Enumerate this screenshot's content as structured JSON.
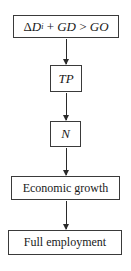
{
  "diagram": {
    "type": "flowchart",
    "direction": "top-to-bottom",
    "nodes": [
      {
        "id": "condition",
        "label": "ΔDi + GD > GO",
        "parts": {
          "delta": "Δ",
          "d": "D",
          "sub_i": "i",
          "plus": " + ",
          "gd": "GD",
          "gt": " > ",
          "go": "GO"
        }
      },
      {
        "id": "tp",
        "label": "TP"
      },
      {
        "id": "n",
        "label": "N"
      },
      {
        "id": "growth",
        "label": "Economic growth"
      },
      {
        "id": "employment",
        "label": "Full employment"
      }
    ],
    "edges": [
      {
        "from": "condition",
        "to": "tp"
      },
      {
        "from": "tp",
        "to": "n"
      },
      {
        "from": "n",
        "to": "growth"
      },
      {
        "from": "growth",
        "to": "employment"
      }
    ]
  }
}
